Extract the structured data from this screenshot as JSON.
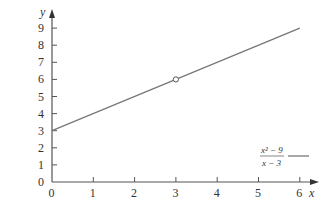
{
  "chart_data": {
    "type": "line",
    "title": "",
    "xlabel": "x",
    "ylabel": "y",
    "xlim": [
      0,
      6
    ],
    "ylim": [
      0,
      9
    ],
    "x_ticks": [
      "0",
      "1",
      "2",
      "3",
      "4",
      "5",
      "6"
    ],
    "y_ticks": [
      "0",
      "1",
      "2",
      "3",
      "4",
      "5",
      "6",
      "7",
      "8",
      "9"
    ],
    "grid": false,
    "legend_position": "lower right",
    "series": [
      {
        "name": "(x^2 - 9)/(x - 3)",
        "legend_numerator": "x² − 9",
        "legend_denominator": "x − 3",
        "x": [
          0,
          6
        ],
        "y": [
          3,
          9
        ],
        "color": "#777777",
        "hole": {
          "x": 3,
          "y": 6
        }
      }
    ]
  }
}
